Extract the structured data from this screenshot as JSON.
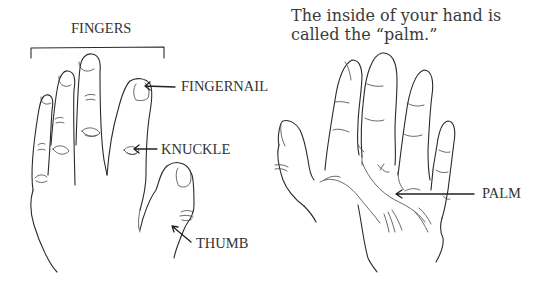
{
  "figure": {
    "left_panel": {
      "title": "Back of the hand",
      "group_label": "FINGERS",
      "callouts": [
        {
          "id": "fingernail",
          "text": "FINGERNAIL"
        },
        {
          "id": "knuckle",
          "text": "KNUCKLE"
        },
        {
          "id": "thumb",
          "text": "THUMB"
        }
      ]
    },
    "right_panel": {
      "caption_line_1": "The inside of your hand is",
      "caption_line_2": "called the “palm.”",
      "callouts": [
        {
          "id": "palm",
          "text": "PALM"
        }
      ]
    },
    "colors": {
      "ink": "#2a2a2a",
      "text": "#333333",
      "background": "#ffffff"
    }
  }
}
